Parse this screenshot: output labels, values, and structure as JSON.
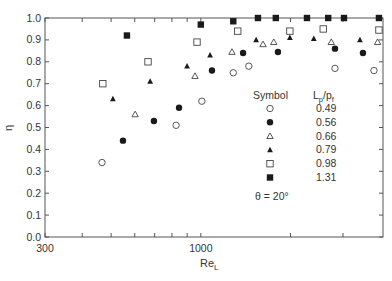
{
  "chart_data": {
    "type": "scatter",
    "title": "",
    "xlabel": "Re_L",
    "xlabel_main": "Re",
    "xlabel_sub": "L",
    "ylabel": "η",
    "xscale": "log",
    "xlim": [
      300,
      4100
    ],
    "ylim": [
      0.0,
      1.0
    ],
    "xticks_labeled": [
      {
        "value": 300,
        "label": "300"
      },
      {
        "value": 1000,
        "label": "1000"
      }
    ],
    "xticks_minor": [
      400,
      500,
      600,
      700,
      800,
      900,
      2000,
      3000
    ],
    "yticks": [
      {
        "value": 0.0,
        "label": "0.0"
      },
      {
        "value": 0.1,
        "label": "0.1"
      },
      {
        "value": 0.2,
        "label": "0.2"
      },
      {
        "value": 0.3,
        "label": "0.3"
      },
      {
        "value": 0.4,
        "label": "0.4"
      },
      {
        "value": 0.5,
        "label": "0.5"
      },
      {
        "value": 0.6,
        "label": "0.6"
      },
      {
        "value": 0.7,
        "label": "0.7"
      },
      {
        "value": 0.8,
        "label": "0.8"
      },
      {
        "value": 0.9,
        "label": "0.9"
      },
      {
        "value": 1.0,
        "label": "1.0"
      }
    ],
    "grid": false,
    "legend": {
      "position": "inside-right",
      "header_symbol": "Symbol",
      "header_param_main": "L",
      "header_param_sub1": "p",
      "header_param_slash": "/p",
      "header_param_sub2": "f",
      "annotation": "θ = 20°"
    },
    "series": [
      {
        "name": "0.49",
        "marker": "open-circle",
        "points": [
          [
            466,
            0.34
          ],
          [
            826,
            0.51
          ],
          [
            1008,
            0.62
          ],
          [
            1285,
            0.75
          ],
          [
            1449,
            0.78
          ],
          [
            2820,
            0.77
          ],
          [
            3810,
            0.76
          ]
        ]
      },
      {
        "name": "0.56",
        "marker": "filled-circle",
        "points": [
          [
            548,
            0.44
          ],
          [
            696,
            0.53
          ],
          [
            845,
            0.59
          ],
          [
            1090,
            0.76
          ],
          [
            1386,
            0.84
          ],
          [
            1815,
            0.845
          ],
          [
            2820,
            0.86
          ],
          [
            3500,
            0.84
          ]
        ]
      },
      {
        "name": "0.66",
        "marker": "open-triangle",
        "points": [
          [
            602,
            0.56
          ],
          [
            956,
            0.735
          ],
          [
            1272,
            0.845
          ],
          [
            1617,
            0.88
          ],
          [
            1757,
            0.89
          ],
          [
            2740,
            0.89
          ],
          [
            3920,
            0.89
          ]
        ]
      },
      {
        "name": "0.79",
        "marker": "filled-triangle",
        "points": [
          [
            507,
            0.63
          ],
          [
            676,
            0.71
          ],
          [
            899,
            0.78
          ],
          [
            1074,
            0.83
          ],
          [
            1533,
            0.9
          ],
          [
            1990,
            0.91
          ],
          [
            2394,
            0.905
          ],
          [
            3420,
            0.9
          ]
        ]
      },
      {
        "name": "0.98",
        "marker": "open-square",
        "points": [
          [
            469,
            0.7
          ],
          [
            665,
            0.8
          ],
          [
            971,
            0.89
          ],
          [
            1330,
            0.94
          ],
          [
            1990,
            0.94
          ],
          [
            2575,
            0.95
          ],
          [
            3960,
            0.945
          ]
        ]
      },
      {
        "name": "1.31",
        "marker": "filled-square",
        "points": [
          [
            565,
            0.92
          ],
          [
            1000,
            0.97
          ],
          [
            1285,
            0.985
          ],
          [
            1555,
            1.0
          ],
          [
            1785,
            1.0
          ],
          [
            2271,
            1.0
          ],
          [
            2676,
            1.0
          ],
          [
            3023,
            1.0
          ],
          [
            3960,
            1.0
          ]
        ]
      }
    ]
  },
  "layout": {
    "plot_left": 45,
    "plot_right": 383,
    "plot_top": 18,
    "plot_bottom": 237,
    "px_per_decade": 298,
    "colors": {
      "axis": "#555555",
      "marker": "#1a1a1a",
      "open_marker": "#444444",
      "text": "#333333"
    }
  }
}
